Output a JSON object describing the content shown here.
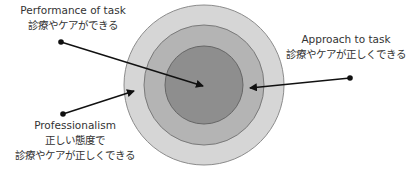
{
  "diagram": {
    "type": "concentric-circles",
    "rings": [
      {
        "name": "outer",
        "cx": 204,
        "cy": 85,
        "r": 80,
        "fill": "#d6d6d6",
        "stroke": "#8c8c8c"
      },
      {
        "name": "middle",
        "cx": 204,
        "cy": 85,
        "r": 60,
        "fill": "#b4b4b4",
        "stroke": "#7a7a7a"
      },
      {
        "name": "inner",
        "cx": 204,
        "cy": 85,
        "r": 39,
        "fill": "#8e8e8e",
        "stroke": "#666666"
      }
    ],
    "labels": {
      "performance": {
        "en": "Performance of task",
        "ja": "診療やケアができる"
      },
      "approach": {
        "en": "Approach to task",
        "ja": "診療やケアが正しくできる"
      },
      "professionalism": {
        "en": "Professionalism",
        "ja_line1": "正しい態度で",
        "ja_line2": "診療やケアが正しくできる"
      }
    },
    "colors": {
      "line": "#111111",
      "text": "#333333"
    }
  }
}
